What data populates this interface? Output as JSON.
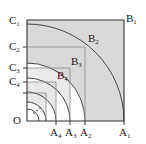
{
  "figure": {
    "type": "geometry-diagram",
    "origin_label": "O",
    "ellipsis": "···",
    "axis": {
      "x_axis_points": [
        {
          "label_base": "A",
          "label_sub": "1",
          "x": 124
        },
        {
          "label_base": "A",
          "label_sub": "2",
          "x": 85
        },
        {
          "label_base": "A",
          "label_sub": "3",
          "x": 70
        },
        {
          "label_base": "A",
          "label_sub": "4",
          "x": 56
        }
      ],
      "y_axis_points": [
        {
          "label_base": "C",
          "label_sub": "1",
          "y": 20
        },
        {
          "label_base": "C",
          "label_sub": "2",
          "y": 47
        },
        {
          "label_base": "C",
          "label_sub": "3",
          "y": 68
        },
        {
          "label_base": "C",
          "label_sub": "4",
          "y": 82
        }
      ]
    },
    "corner_points": [
      {
        "label_base": "B",
        "label_sub": "1",
        "x": 124,
        "y": 20
      },
      {
        "label_base": "B",
        "label_sub": "2",
        "x": 85,
        "y": 47
      },
      {
        "label_base": "B",
        "label_sub": "3",
        "x": 70,
        "y": 68
      },
      {
        "label_base": "B",
        "label_sub": "4",
        "x": 56,
        "y": 82
      }
    ],
    "arc_radii": [
      97,
      58,
      43,
      29,
      19,
      12
    ],
    "colors": {
      "stroke": "#333333",
      "fill_shade": "#d9d9d9",
      "grid": "#888888",
      "text": "#1a1a1a",
      "background": "#ffffff"
    }
  }
}
